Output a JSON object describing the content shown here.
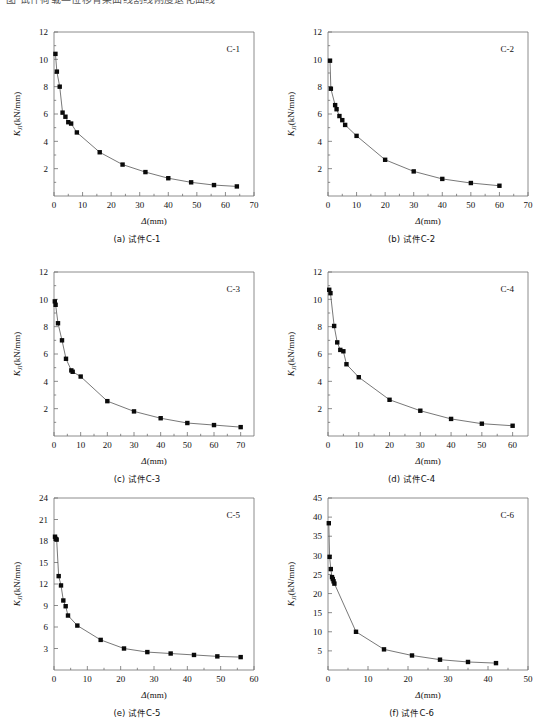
{
  "page": {
    "cut_off_header_text": "图 试件荷载—位移骨架曲线割线刚度退化曲线",
    "axis_x_label": "Δ(mm)",
    "axis_y_label": "Kⱼᴵ(kN/mm)",
    "y_label_main": "K",
    "y_label_sub": "JI",
    "y_label_unit": "(kN/mm)"
  },
  "chart_data": [
    {
      "id": "c1",
      "type": "line",
      "title": "C-1",
      "caption": "(a) 试件C-1",
      "xlabel": "Δ(mm)",
      "ylabel": "Kᴶᴵ(kN/mm)",
      "xlim": [
        0,
        70
      ],
      "ylim": [
        0,
        12
      ],
      "xticks": [
        0,
        10,
        20,
        30,
        40,
        50,
        60,
        70
      ],
      "yticks": [
        2,
        4,
        6,
        8,
        10,
        12
      ],
      "y_minor": true,
      "grid": false,
      "legend": "none",
      "x": [
        0.5,
        1.0,
        2.0,
        3.0,
        4.0,
        5.0,
        6.0,
        8.0,
        16.0,
        24.0,
        32.0,
        40.0,
        48.0,
        56.0,
        64.0
      ],
      "y": [
        10.4,
        9.1,
        8.0,
        6.1,
        5.8,
        5.4,
        5.3,
        4.65,
        3.2,
        2.3,
        1.75,
        1.3,
        1.0,
        0.8,
        0.7
      ]
    },
    {
      "id": "c2",
      "type": "line",
      "title": "C-2",
      "caption": "(b) 试件C-2",
      "xlabel": "Δ(mm)",
      "ylabel": "Kᴶᴵ(kN/mm)",
      "xlim": [
        0,
        70
      ],
      "ylim": [
        0,
        12
      ],
      "xticks": [
        0,
        10,
        20,
        30,
        40,
        50,
        60,
        70
      ],
      "yticks": [
        2,
        4,
        6,
        8,
        10,
        12
      ],
      "y_minor": true,
      "grid": false,
      "legend": "none",
      "x": [
        0.7,
        1.0,
        2.5,
        3.0,
        4.0,
        5.0,
        6.0,
        10.0,
        20.0,
        30.0,
        40.0,
        50.0,
        60.0
      ],
      "y": [
        9.9,
        7.85,
        6.65,
        6.35,
        5.85,
        5.55,
        5.2,
        4.4,
        2.65,
        1.8,
        1.25,
        0.95,
        0.75
      ]
    },
    {
      "id": "c3",
      "type": "line",
      "title": "C-3",
      "caption": "(c) 试件C-3",
      "xlabel": "Δ(mm)",
      "ylabel": "Kᴶᴵ(kN/mm)",
      "xlim": [
        0,
        75
      ],
      "ylim": [
        0,
        12
      ],
      "xticks": [
        0,
        10,
        20,
        30,
        40,
        50,
        60,
        70
      ],
      "yticks": [
        2,
        4,
        6,
        8,
        10,
        12
      ],
      "y_minor": true,
      "grid": false,
      "legend": "none",
      "x": [
        0.3,
        0.6,
        1.5,
        3.0,
        4.5,
        6.5,
        7.0,
        10.0,
        20.0,
        30.0,
        40.0,
        50.0,
        60.0,
        70.0
      ],
      "y": [
        9.85,
        9.6,
        8.25,
        7.0,
        5.65,
        4.8,
        4.7,
        4.35,
        2.55,
        1.8,
        1.3,
        0.95,
        0.8,
        0.65
      ]
    },
    {
      "id": "c4",
      "type": "line",
      "title": "C-4",
      "caption": "(d) 试件C-4",
      "xlabel": "Δ(mm)",
      "ylabel": "Kᴶᴵ(kN/mm)",
      "xlim": [
        0,
        65
      ],
      "ylim": [
        0,
        12
      ],
      "xticks": [
        0,
        10,
        20,
        30,
        40,
        50,
        60
      ],
      "yticks": [
        2,
        4,
        6,
        8,
        10,
        12
      ],
      "y_minor": true,
      "grid": false,
      "legend": "none",
      "x": [
        0.4,
        0.8,
        2.0,
        3.0,
        4.0,
        5.0,
        6.0,
        10.0,
        20.0,
        30.0,
        40.0,
        50.0,
        60.0
      ],
      "y": [
        10.7,
        10.45,
        8.05,
        6.85,
        6.3,
        6.2,
        5.25,
        4.3,
        2.65,
        1.85,
        1.25,
        0.9,
        0.75
      ]
    },
    {
      "id": "c5",
      "type": "line",
      "title": "C-5",
      "caption": "(e) 试件C-5",
      "xlabel": "Δ(mm)",
      "ylabel": "Kᴶᴵ(kN/mm)",
      "xlim": [
        0,
        60
      ],
      "ylim": [
        0,
        24
      ],
      "xticks": [
        0,
        10,
        20,
        30,
        40,
        50,
        60
      ],
      "yticks": [
        3,
        6,
        9,
        12,
        15,
        18,
        21,
        24
      ],
      "y_minor": false,
      "grid": false,
      "legend": "none",
      "x": [
        0.3,
        0.5,
        0.8,
        1.4,
        2.1,
        2.8,
        3.5,
        4.2,
        7.0,
        14.0,
        21.0,
        28.0,
        35.0,
        42.0,
        49.0,
        56.0
      ],
      "y": [
        18.6,
        18.3,
        18.2,
        13.1,
        11.8,
        9.7,
        8.9,
        7.6,
        6.2,
        4.2,
        3.0,
        2.5,
        2.3,
        2.1,
        1.9,
        1.8
      ]
    },
    {
      "id": "c6",
      "type": "line",
      "title": "C-6",
      "caption": "(f) 试件C-6",
      "xlabel": "Δ(mm)",
      "ylabel": "Kᴶᴵ(kN/mm)",
      "xlim": [
        0,
        50
      ],
      "ylim": [
        0,
        45
      ],
      "xticks": [
        0,
        10,
        20,
        30,
        40,
        50
      ],
      "yticks": [
        5,
        10,
        15,
        20,
        25,
        30,
        35,
        40,
        45
      ],
      "y_minor": false,
      "grid": false,
      "legend": "none",
      "x": [
        0.2,
        0.4,
        0.7,
        1.0,
        1.2,
        1.4,
        1.6,
        7.0,
        14.0,
        21.0,
        28.0,
        35.0,
        42.0
      ],
      "y": [
        38.4,
        29.6,
        26.4,
        24.3,
        23.8,
        23.2,
        22.6,
        10.0,
        5.4,
        3.8,
        2.7,
        2.1,
        1.8
      ]
    }
  ]
}
